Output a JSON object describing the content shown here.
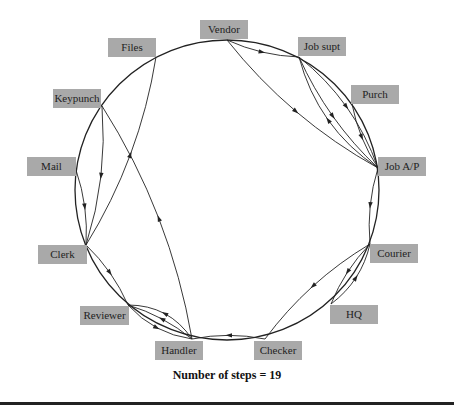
{
  "diagram": {
    "type": "circular-flow",
    "caption": "Number of steps = 19",
    "colors": {
      "node_fill": "#a9a9a9",
      "edge": "#222222",
      "text": "#222222"
    },
    "nodes": [
      {
        "id": "vendor",
        "label": "Vendor",
        "box": [
          200,
          20,
          48,
          18
        ],
        "anchor": [
          227,
          40
        ]
      },
      {
        "id": "jobsupt",
        "label": "Job supt",
        "box": [
          298,
          37,
          48,
          19
        ],
        "anchor": [
          299,
          57
        ]
      },
      {
        "id": "purch",
        "label": "Purch",
        "box": [
          351,
          85,
          48,
          19
        ],
        "anchor": [
          352,
          104
        ]
      },
      {
        "id": "jobap",
        "label": "Job A/P",
        "box": [
          378,
          157,
          48,
          19
        ],
        "anchor": [
          378,
          168
        ]
      },
      {
        "id": "courier",
        "label": "Courier",
        "box": [
          370,
          244,
          48,
          19
        ],
        "anchor": [
          370,
          244
        ]
      },
      {
        "id": "hq",
        "label": "HQ",
        "box": [
          330,
          305,
          48,
          19
        ],
        "anchor": [
          331,
          304
        ]
      },
      {
        "id": "checker",
        "label": "Checker",
        "box": [
          254,
          341,
          48,
          19
        ],
        "anchor": [
          265,
          339
        ]
      },
      {
        "id": "handler",
        "label": "Handler",
        "box": [
          155,
          341,
          48,
          19
        ],
        "anchor": [
          192,
          339
        ]
      },
      {
        "id": "reviewer",
        "label": "Reviewer",
        "box": [
          80,
          306,
          49,
          19
        ],
        "anchor": [
          128,
          305
        ]
      },
      {
        "id": "clerk",
        "label": "Clerk",
        "box": [
          38,
          245,
          49,
          19
        ],
        "anchor": [
          86,
          245
        ]
      },
      {
        "id": "mail",
        "label": "Mail",
        "box": [
          27,
          157,
          49,
          19
        ],
        "anchor": [
          76,
          170
        ]
      },
      {
        "id": "keypunch",
        "label": "Keypunch",
        "box": [
          53,
          89,
          48,
          19
        ],
        "anchor": [
          102,
          106
        ]
      },
      {
        "id": "files",
        "label": "Files",
        "box": [
          108,
          38,
          48,
          19
        ],
        "anchor": [
          156,
          57
        ]
      }
    ],
    "edges": [
      {
        "from": "vendor",
        "to": "jobsupt"
      },
      {
        "from": "vendor",
        "to": "jobap"
      },
      {
        "from": "jobsupt",
        "to": "jobap"
      },
      {
        "from": "jobsupt",
        "to": "jobap"
      },
      {
        "from": "jobap",
        "to": "jobsupt"
      },
      {
        "from": "purch",
        "to": "jobap"
      },
      {
        "from": "jobap",
        "to": "courier"
      },
      {
        "from": "courier",
        "to": "hq"
      },
      {
        "from": "hq",
        "to": "courier"
      },
      {
        "from": "courier",
        "to": "checker"
      },
      {
        "from": "checker",
        "to": "handler"
      },
      {
        "from": "handler",
        "to": "reviewer"
      },
      {
        "from": "reviewer",
        "to": "handler"
      },
      {
        "from": "handler",
        "to": "reviewer"
      },
      {
        "from": "clerk",
        "to": "reviewer"
      },
      {
        "from": "handler",
        "to": "keypunch"
      },
      {
        "from": "keypunch",
        "to": "clerk"
      },
      {
        "from": "mail",
        "to": "clerk"
      },
      {
        "from": "clerk",
        "to": "files"
      }
    ]
  }
}
